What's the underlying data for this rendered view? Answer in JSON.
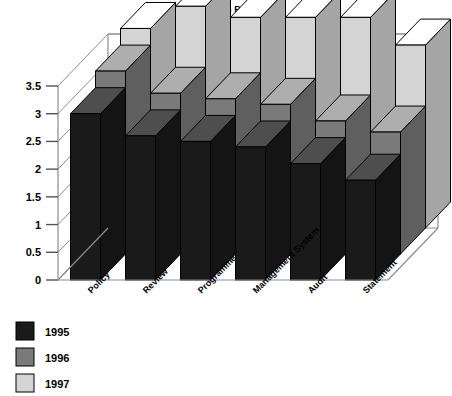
{
  "chart_data": {
    "type": "bar",
    "render": "3d-column",
    "title": "LA-EMAS Profile",
    "subtitle": "1995–1996–1997",
    "xlabel": "",
    "ylabel": "",
    "ylim": [
      0,
      3.5
    ],
    "yticks": [
      "0",
      "0.5",
      "1",
      "1.5",
      "2",
      "2.5",
      "3",
      "3.5"
    ],
    "ytick_values": [
      0,
      0.5,
      1,
      1.5,
      2,
      2.5,
      3,
      3.5
    ],
    "grid": true,
    "legend_position": "bottom-left",
    "categories": [
      "Policy",
      "Review",
      "Programme",
      "Management System",
      "Audit",
      "Statement"
    ],
    "series": [
      {
        "name": "1995",
        "color": "#1a1a1a",
        "values": [
          3.0,
          2.6,
          2.5,
          2.4,
          2.1,
          1.8
        ]
      },
      {
        "name": "1996",
        "color": "#7a7a7a",
        "values": [
          3.3,
          2.9,
          2.8,
          2.7,
          2.4,
          2.2
        ]
      },
      {
        "name": "1997",
        "color": "#d4d4d4",
        "values": [
          3.6,
          4.0,
          3.8,
          3.8,
          3.8,
          3.3
        ]
      }
    ],
    "colors": {
      "series_1995": "#1a1a1a",
      "series_1996": "#7a7a7a",
      "series_1997": "#d4d4d4",
      "axis": "#8c8c8c",
      "grid": "#8c8c8c",
      "outline": "#000000",
      "background": "#ffffff",
      "text": "#000000"
    }
  },
  "legend": {
    "items": [
      {
        "label": "1995",
        "swatch": "#1a1a1a"
      },
      {
        "label": "1996",
        "swatch": "#7a7a7a"
      },
      {
        "label": "1997",
        "swatch": "#d4d4d4"
      }
    ]
  }
}
